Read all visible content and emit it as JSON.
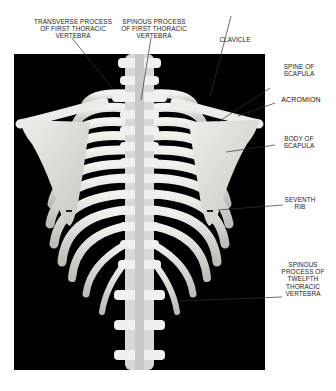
{
  "figure": {
    "labels": {
      "transverse_process": [
        "TRANSVERSE PROCESS",
        "OF FIRST THORACIC",
        "VERTEBRA"
      ],
      "spinous_process_first": [
        "SPINOUS PROCESS",
        "OF FIRST THORACIC",
        "VERTEBRA"
      ],
      "clavicle": [
        "CLAVICLE"
      ],
      "spine_of_scapula": [
        "SPINE OF",
        "SCAPULA"
      ],
      "acromion": [
        "ACROMION"
      ],
      "body_of_scapula": [
        "BODY OF",
        "SCAPULA"
      ],
      "seventh_rib": [
        "SEVENTH",
        "RIB"
      ],
      "spinous_process_twelfth": [
        "SPINOUS",
        "PROCESS OF",
        "TWELFTH",
        "THORACIC",
        "VERTEBRA"
      ]
    },
    "colors": {
      "background": "#000000",
      "bone": "#e8e8e4",
      "label_text": "#222222",
      "leader_line": "#333333"
    }
  }
}
